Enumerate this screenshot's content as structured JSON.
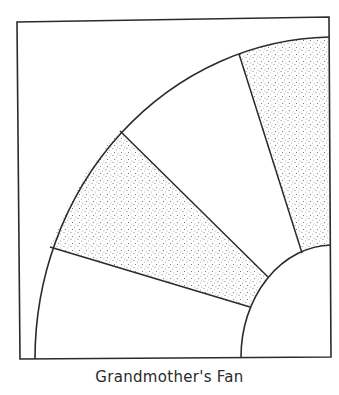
{
  "diagram": {
    "title": "Grandmother's Fan",
    "colors": {
      "line": "#2b2b2b",
      "background": "#ffffff",
      "stipple": "#7a7a7a"
    },
    "block": {
      "corners": [
        [
          17,
          22
        ],
        [
          329,
          17
        ],
        [
          331,
          357
        ],
        [
          20,
          359
        ]
      ]
    },
    "outer_arc": {
      "start": [
        35,
        359
      ],
      "end": [
        329,
        37
      ],
      "rx": 300,
      "ry": 322
    },
    "inner_arc": {
      "start": [
        241,
        357
      ],
      "end": [
        331,
        245
      ],
      "rx": 92,
      "ry": 112
    },
    "spokes": [
      {
        "outer": [
          50,
          247
        ],
        "inner": [
          250,
          307
        ]
      },
      {
        "outer": [
          120,
          131
        ],
        "inner": [
          268,
          277
        ]
      },
      {
        "outer": [
          239,
          54
        ],
        "inner": [
          302,
          253
        ]
      }
    ],
    "blades": [
      {
        "name": "blade-1",
        "shaded": false
      },
      {
        "name": "blade-2",
        "shaded": true
      },
      {
        "name": "blade-3",
        "shaded": false
      },
      {
        "name": "blade-4",
        "shaded": true
      }
    ]
  }
}
